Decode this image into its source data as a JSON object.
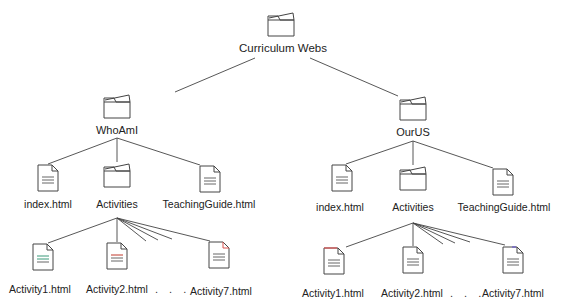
{
  "diagram": {
    "root": {
      "label": "Curriculum Webs",
      "icon": "folder-icon"
    },
    "branches": [
      {
        "label": "WhoAmI",
        "icon": "folder-icon",
        "children": [
          {
            "label": "index.html",
            "icon": "document-icon"
          },
          {
            "label": "Activities",
            "icon": "folder-icon"
          },
          {
            "label": "TeachingGuide.html",
            "icon": "document-icon"
          }
        ],
        "activities": [
          {
            "label": "Activity1.html",
            "icon": "document-icon",
            "accent": "#3a9a7a"
          },
          {
            "label": "Activity2.html",
            "icon": "document-icon",
            "accent": "#c0392b"
          },
          {
            "label": "Activity7.html",
            "icon": "document-icon",
            "accent": "#d9534f"
          }
        ],
        "ellipsis": ". . ."
      },
      {
        "label": "OurUS",
        "icon": "folder-icon",
        "children": [
          {
            "label": "index.html",
            "icon": "document-icon"
          },
          {
            "label": "Activities",
            "icon": "folder-icon"
          },
          {
            "label": "TeachingGuide.html",
            "icon": "document-icon"
          }
        ],
        "activities": [
          {
            "label": "Activity1.html",
            "icon": "document-icon",
            "accent": "#e05555"
          },
          {
            "label": "Activity2.html",
            "icon": "document-icon",
            "accent": "#555555"
          },
          {
            "label": "Activity7.html",
            "icon": "document-icon",
            "accent": "#6a5acd"
          }
        ],
        "ellipsis": ". . ."
      }
    ]
  }
}
